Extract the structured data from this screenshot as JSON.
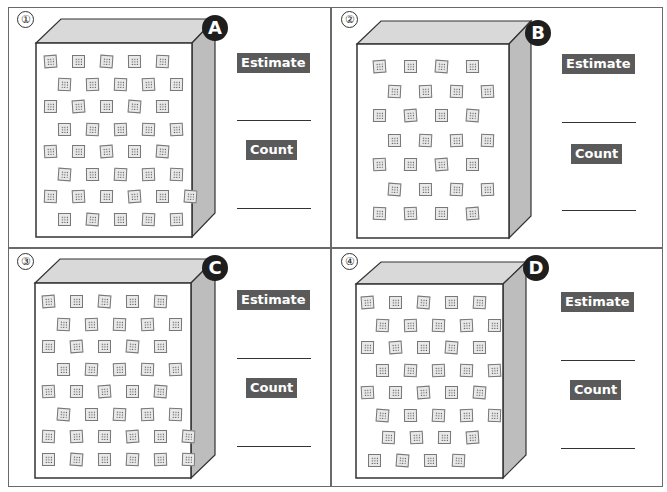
{
  "worksheet": {
    "panels": [
      {
        "number": "①",
        "letter": "A",
        "estimate_label": "Estimate",
        "count_label": "Count",
        "estimate_value": "",
        "count_value": "",
        "rows": [
          5,
          5,
          5,
          5,
          5,
          5,
          6,
          5
        ],
        "total_tiles": 41
      },
      {
        "number": "②",
        "letter": "B",
        "estimate_label": "Estimate",
        "count_label": "Count",
        "estimate_value": "",
        "count_value": "",
        "rows": [
          4,
          4,
          4,
          4,
          4,
          4,
          4
        ],
        "total_tiles": 28
      },
      {
        "number": "③",
        "letter": "C",
        "estimate_label": "Estimate",
        "count_label": "Count",
        "estimate_value": "",
        "count_value": "",
        "rows": [
          5,
          5,
          5,
          5,
          5,
          5,
          6,
          6
        ],
        "total_tiles": 42
      },
      {
        "number": "④",
        "letter": "D",
        "estimate_label": "Estimate",
        "count_label": "Count",
        "estimate_value": "",
        "count_value": "",
        "rows": [
          5,
          5,
          5,
          5,
          5,
          5,
          4,
          4
        ],
        "total_tiles": 38
      }
    ]
  },
  "colors": {
    "label_bg": "#5a5a5a",
    "badge_bg": "#1e1e1e",
    "box_top": "#d9d9d9",
    "box_side": "#bdbdbd",
    "border": "#6a6a6a"
  }
}
